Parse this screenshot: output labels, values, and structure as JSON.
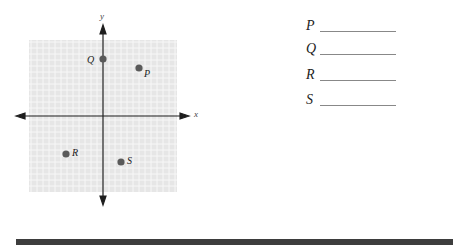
{
  "graph": {
    "x_axis_label": "x",
    "y_axis_label": "y",
    "points": [
      {
        "label": "P",
        "cx": 139,
        "cy": 68,
        "label_dx": 5,
        "label_dy": 1
      },
      {
        "label": "Q",
        "cx": 103,
        "cy": 59,
        "label_dx": -16,
        "label_dy": -4
      },
      {
        "label": "R",
        "cx": 66,
        "cy": 154,
        "label_dx": 6,
        "label_dy": -6
      },
      {
        "label": "S",
        "cx": 121,
        "cy": 162,
        "label_dx": 6,
        "label_dy": -6
      }
    ],
    "colors": {
      "grid_fill": "#e6e6e6",
      "grid_line": "#f7f7f7",
      "axis": "#1e1e1e",
      "point": "#5a5a5a"
    }
  },
  "answers": [
    {
      "label": "P"
    },
    {
      "label": "Q"
    },
    {
      "label": "R"
    },
    {
      "label": "S"
    }
  ]
}
